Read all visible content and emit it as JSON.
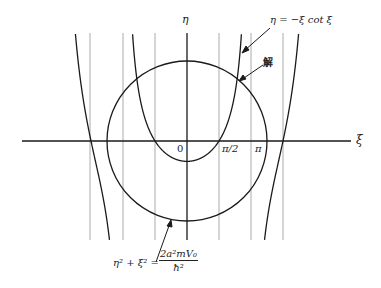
{
  "figure": {
    "type": "graphical-solution",
    "colors": {
      "curve": "#1a1a1a",
      "gridline": "#aaaaaa",
      "axis": "#1a1a1a",
      "background": "#ffffff"
    },
    "axes": {
      "x_label": "ξ",
      "y_label": "η",
      "origin_label": "0",
      "tick_labels": [
        "π/2",
        "π"
      ]
    },
    "annotations": {
      "curve_equation": "η = −ξ cot ξ",
      "solution_label": "解",
      "circle_equation_lhs": "η² + ξ² =",
      "circle_equation_numerator": "2a²mV₀",
      "circle_equation_denominator": "ħ²"
    },
    "asymptote_lines_xi": [
      "-3π/2",
      "-π",
      "-π/2",
      "π/2",
      "π",
      "3π/2"
    ],
    "circle_radius_units": 3.93
  }
}
